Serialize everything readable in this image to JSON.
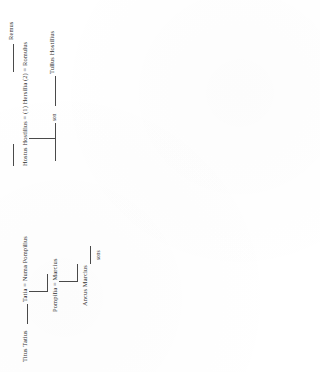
{
  "document": {
    "type": "genealogical-table",
    "orientation": "rotated-90-ccw",
    "title": ""
  },
  "tree": {
    "romulus_branch": {
      "remus": {
        "label": "Remus",
        "footnote": ""
      },
      "union": {
        "left_spouse": "Hostus Hostilius",
        "marriage_sign_1": "=",
        "order_1": "(1)",
        "center": "Hersilia",
        "center_footnote": "c",
        "order_2": "(2)",
        "marriage_sign_2": "=",
        "right_spouse": "Romulus",
        "right_footnote": "d",
        "full_label": "Hostus Hostilius = (1) Hersilia (2) = Romulus"
      },
      "child_generic": "son",
      "grandchild": {
        "label": "Tullus Hostilius",
        "footnote": "e"
      }
    },
    "tatius_branch": {
      "root": {
        "label": "Titus Tatius",
        "footnote": "a"
      },
      "union_1": {
        "left_spouse": "Tatia",
        "marriage_sign": "=",
        "right_spouse": "Numa Pompilius",
        "right_footnote": "b",
        "full_label": "Tatia = Numa Pompilius"
      },
      "union_2": {
        "left_spouse": "Pompilia",
        "marriage_sign": "=",
        "right_spouse": "Marcius",
        "full_label": "Pompilia = Marcius"
      },
      "child": {
        "label": "Ancus Marcius",
        "footnote": "m"
      },
      "descendants": "sons"
    }
  },
  "colors": {
    "ink": "#2f2f2f",
    "rule": "#4a4a4a",
    "paper": "#ffffff"
  }
}
